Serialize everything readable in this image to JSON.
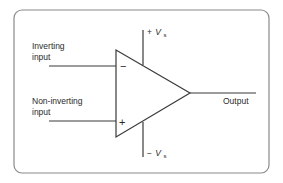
{
  "diagram": {
    "labels": {
      "inverting_input": [
        "Inverting",
        "input"
      ],
      "non_inverting_input": [
        "Non-inverting",
        "input"
      ],
      "output": "Output",
      "positive_supply": {
        "sign": "+",
        "v": "V",
        "sub": "s"
      },
      "negative_supply": {
        "sign": "−",
        "v": "V",
        "sub": "s"
      },
      "minus_terminal": "−",
      "plus_terminal": "+"
    },
    "colors": {
      "line": "#3a3a3a",
      "frame": "#8a8a8a",
      "background": "#ffffff"
    }
  }
}
